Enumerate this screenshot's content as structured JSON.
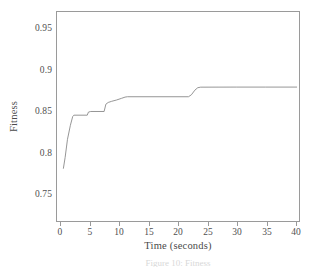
{
  "figure": {
    "background_color": "#ffffff",
    "frame_color": "#9a9a9a",
    "line_color": "#8a8a8a",
    "caption": "Figure 10: Fitness"
  },
  "chart_data": {
    "type": "line",
    "title": "",
    "subtitle": "",
    "xlabel": "Time (seconds)",
    "ylabel": "Fitness",
    "xlim": [
      -0.8,
      40.8
    ],
    "ylim": [
      0.7275,
      0.9655
    ],
    "xticks": [
      0,
      5,
      10,
      15,
      20,
      25,
      30,
      35,
      40
    ],
    "xticklabels": [
      "0",
      "5",
      "10",
      "15",
      "20",
      "25",
      "30",
      "35",
      "40"
    ],
    "yticks": [
      0.75,
      0.8,
      0.85,
      0.9,
      0.95
    ],
    "yticklabels": [
      "0.75",
      "0.8",
      "0.85",
      "0.9",
      "0.95"
    ],
    "grid": false,
    "legend": null,
    "legend_position": "none",
    "series": [
      {
        "name": "Fitness",
        "color": "#8a8a8a",
        "x": [
          0.3,
          0.6,
          1.0,
          1.5,
          1.9,
          2.1,
          4.4,
          4.6,
          5.0,
          7.3,
          7.6,
          8.0,
          8.6,
          9.4,
          10.3,
          10.9,
          11.3,
          21.8,
          22.3,
          22.9,
          23.4,
          23.9,
          30.0,
          35.0,
          40.4
        ],
        "y": [
          0.7875,
          0.8,
          0.8205,
          0.8365,
          0.8465,
          0.848,
          0.848,
          0.8515,
          0.8522,
          0.8522,
          0.8605,
          0.8625,
          0.8638,
          0.8652,
          0.8672,
          0.8686,
          0.869,
          0.869,
          0.8712,
          0.8765,
          0.8793,
          0.8799,
          0.88,
          0.88,
          0.88
        ]
      }
    ],
    "annotations": []
  }
}
